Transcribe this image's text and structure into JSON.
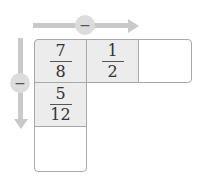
{
  "diagram": {
    "horizontal_operator": "−",
    "vertical_operator": "−",
    "row_cells": [
      {
        "numerator": "7",
        "denominator": "8"
      },
      {
        "numerator": "1",
        "denominator": "2"
      },
      {
        "numerator": "",
        "denominator": ""
      }
    ],
    "column_cells": [
      {
        "numerator": "5",
        "denominator": "12"
      },
      {
        "numerator": "",
        "denominator": ""
      }
    ]
  }
}
